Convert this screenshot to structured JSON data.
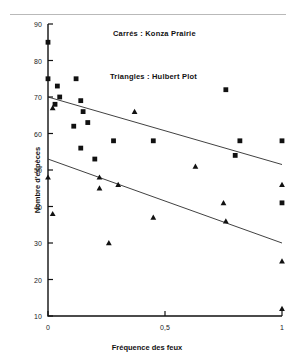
{
  "figure": {
    "background": "#ffffff",
    "marker_color": "#111111",
    "line_color": "#2b2b2b"
  },
  "legend": {
    "squares": "Carrés : Konza Prairie",
    "triangles": "Triangles : Hulbert Plot"
  },
  "axes": {
    "xlabel": "Fréquence des feux",
    "ylabel": "Nombre d'espèces",
    "xticks": [
      "0",
      "0,5",
      "1"
    ],
    "xtick_values": [
      0,
      0.5,
      1
    ],
    "yticks": [
      "10",
      "20",
      "30",
      "40",
      "50",
      "60",
      "70",
      "80",
      "90"
    ],
    "ytick_values": [
      10,
      20,
      30,
      40,
      50,
      60,
      70,
      80,
      90
    ]
  },
  "chart_data": {
    "type": "scatter",
    "title": "",
    "xlabel": "Fréquence des feux",
    "ylabel": "Nombre d'espèces",
    "xlim": [
      0,
      1
    ],
    "ylim": [
      10,
      90
    ],
    "grid": false,
    "legend_position": "inside-top-center",
    "series": [
      {
        "name": "Konza Prairie",
        "marker": "square",
        "color": "#111111",
        "points": [
          [
            0.0,
            85
          ],
          [
            0.0,
            75
          ],
          [
            0.04,
            73
          ],
          [
            0.05,
            70
          ],
          [
            0.03,
            68
          ],
          [
            0.12,
            75
          ],
          [
            0.14,
            69
          ],
          [
            0.15,
            66
          ],
          [
            0.17,
            63
          ],
          [
            0.11,
            62
          ],
          [
            0.14,
            56
          ],
          [
            0.2,
            53
          ],
          [
            0.28,
            58
          ],
          [
            0.45,
            58
          ],
          [
            0.76,
            72
          ],
          [
            0.82,
            58
          ],
          [
            0.8,
            54
          ],
          [
            1.0,
            58
          ],
          [
            1.0,
            41
          ]
        ]
      },
      {
        "name": "Hulbert Plot",
        "marker": "triangle",
        "color": "#111111",
        "points": [
          [
            0.02,
            67
          ],
          [
            0.0,
            48
          ],
          [
            0.02,
            38
          ],
          [
            0.37,
            66
          ],
          [
            0.22,
            48
          ],
          [
            0.22,
            45
          ],
          [
            0.3,
            46
          ],
          [
            0.63,
            51
          ],
          [
            0.26,
            30
          ],
          [
            0.45,
            37
          ],
          [
            0.75,
            41
          ],
          [
            0.76,
            36
          ],
          [
            1.0,
            46
          ],
          [
            1.0,
            25
          ],
          [
            1.0,
            12
          ]
        ]
      }
    ],
    "trend_lines": [
      {
        "name": "Konza Prairie regression",
        "x": [
          0,
          1
        ],
        "y": [
          70,
          51.5
        ]
      },
      {
        "name": "Hulbert Plot regression",
        "x": [
          0,
          1
        ],
        "y": [
          53,
          30
        ]
      }
    ]
  }
}
